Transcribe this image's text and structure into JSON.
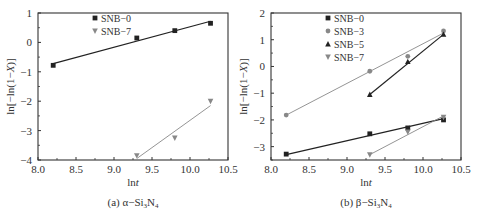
{
  "chart_data": [
    {
      "type": "scatter",
      "title": "",
      "caption": "(a) α−Si3N4",
      "caption_prefix": "(a) α−Si",
      "caption_sub1": "3",
      "caption_mid": "N",
      "caption_sub2": "4",
      "xlabel": "lnt",
      "ylabel": "ln[−ln(1−X)]",
      "xlim": [
        8.0,
        10.5
      ],
      "ylim": [
        -4,
        1
      ],
      "xticks": [
        "8.0",
        "8.5",
        "9.0",
        "9.5",
        "10.0",
        "10.5"
      ],
      "yticks": [
        "1",
        "0",
        "−1",
        "−2",
        "−3",
        "−4"
      ],
      "legend_position": "upper-center",
      "series": [
        {
          "name": "SNB−0",
          "marker": "square",
          "color": "#222222",
          "x": [
            8.2,
            9.3,
            9.8,
            10.27
          ],
          "y": [
            -0.78,
            0.15,
            0.4,
            0.65
          ],
          "fit": [
            [
              8.2,
              -0.72
            ],
            [
              10.27,
              0.72
            ]
          ]
        },
        {
          "name": "SNB−7",
          "marker": "triangle-down",
          "color": "#888888",
          "x": [
            9.3,
            9.8,
            10.27
          ],
          "y": [
            -3.85,
            -3.25,
            -2.0
          ],
          "fit": [
            [
              9.3,
              -3.95
            ],
            [
              10.27,
              -2.15
            ]
          ]
        }
      ]
    },
    {
      "type": "scatter",
      "title": "",
      "caption": "(b) β−Si3N4",
      "caption_prefix": "(b) β−Si",
      "caption_sub1": "3",
      "caption_mid": "N",
      "caption_sub2": "4",
      "xlabel": "lnt",
      "ylabel": "ln[−ln(1−X)]",
      "xlim": [
        8.0,
        10.5
      ],
      "ylim": [
        -3.5,
        2
      ],
      "xticks": [
        "8.0",
        "8.5",
        "9.0",
        "9.5",
        "10.0",
        "10.5"
      ],
      "yticks": [
        "2",
        "1",
        "0",
        "−1",
        "−2",
        "−3"
      ],
      "legend_position": "upper-center",
      "series": [
        {
          "name": "SNB−0",
          "marker": "square",
          "color": "#222222",
          "x": [
            8.2,
            9.3,
            9.8,
            10.27
          ],
          "y": [
            -3.28,
            -2.52,
            -2.3,
            -2.0
          ],
          "fit": [
            [
              8.2,
              -3.3
            ],
            [
              10.27,
              -1.95
            ]
          ]
        },
        {
          "name": "SNB−3",
          "marker": "circle",
          "color": "#888888",
          "x": [
            8.2,
            9.3,
            9.8,
            10.27
          ],
          "y": [
            -1.82,
            -0.18,
            0.38,
            1.33
          ],
          "fit": [
            [
              8.2,
              -1.82
            ],
            [
              10.27,
              1.25
            ]
          ]
        },
        {
          "name": "SNB−5",
          "marker": "triangle-up",
          "color": "#222222",
          "x": [
            9.3,
            9.8,
            10.27
          ],
          "y": [
            -1.05,
            0.18,
            1.2
          ],
          "fit": [
            [
              9.3,
              -1.05
            ],
            [
              10.27,
              1.2
            ]
          ]
        },
        {
          "name": "SNB−7",
          "marker": "triangle-down",
          "color": "#888888",
          "x": [
            9.3,
            9.8,
            10.27
          ],
          "y": [
            -3.3,
            -2.45,
            -1.9
          ],
          "fit": [
            [
              9.3,
              -3.3
            ],
            [
              10.27,
              -1.85
            ]
          ]
        }
      ]
    }
  ]
}
